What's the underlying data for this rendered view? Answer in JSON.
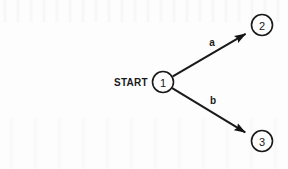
{
  "figure": {
    "type": "state-transition-diagram",
    "background_color": "#fdfdfd",
    "ink_color": "#1a1a1a",
    "width": 288,
    "height": 169
  },
  "start_marker": {
    "label": "START",
    "x": 148,
    "y": 82,
    "points_to_state": "1"
  },
  "states": [
    {
      "id": "1",
      "label": "1",
      "cx": 163,
      "cy": 82,
      "r": 10.5,
      "is_start": true,
      "is_accepting": false
    },
    {
      "id": "2",
      "label": "2",
      "cx": 262,
      "cy": 25,
      "r": 10.5,
      "is_start": false,
      "is_accepting": false
    },
    {
      "id": "3",
      "label": "3",
      "cx": 262,
      "cy": 141,
      "r": 10.5,
      "is_start": false,
      "is_accepting": false
    }
  ],
  "transitions": [
    {
      "id": "t-a",
      "label": "a",
      "from": "1",
      "to": "2",
      "label_x": 212,
      "label_y": 42,
      "path": "M 172.8 76.3 L 245.6 33.9",
      "arrowhead": "solid-triangle"
    },
    {
      "id": "t-b",
      "label": "b",
      "from": "1",
      "to": "3",
      "label_x": 213,
      "label_y": 100,
      "path": "M 172.2 88.2 L 245.2 132.4",
      "arrowhead": "solid-triangle"
    }
  ],
  "style": {
    "stroke_width": 1.6,
    "edge_stroke_width": 2.1,
    "arrow_length": 9,
    "arrow_width": 6
  }
}
